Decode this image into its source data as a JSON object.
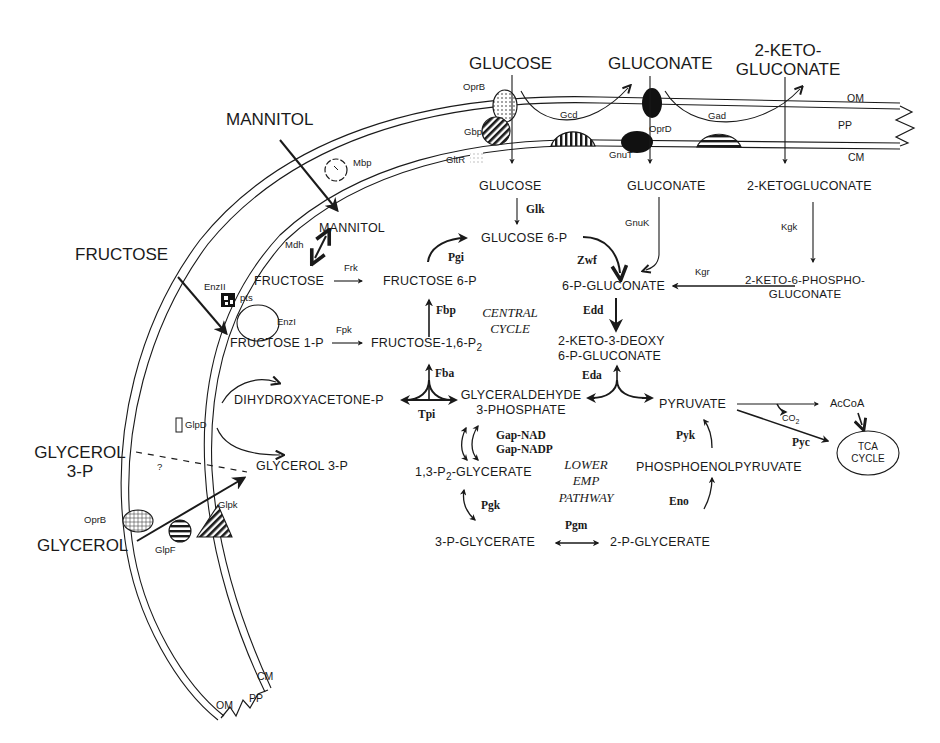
{
  "membrane": {
    "outer_membrane": "OM",
    "periplasm": "PP",
    "cytoplasmic_membrane": "CM"
  },
  "external_substrates": {
    "glucose": "GLUCOSE",
    "gluconate": "GLUCONATE",
    "ketogluconate_line1": "2-KETO-",
    "ketogluconate_line2": "GLUCONATE",
    "mannitol": "MANNITOL",
    "fructose": "FRUCTOSE",
    "glycerol3p_line1": "GLYCEROL",
    "glycerol3p_line2": "3-P",
    "glycerol": "GLYCEROL"
  },
  "transporters": {
    "oprB_top": "OprB",
    "gbp": "Gbp",
    "gltR": "GltR",
    "gcd": "Gcd",
    "oprD": "OprD",
    "gnuT": "GnuT",
    "gad": "Gad",
    "mbp": "Mbp",
    "enzII": "EnzII",
    "pts": "pts",
    "enzI": "EnzI",
    "glpD": "GlpD",
    "question": "?",
    "oprB_bottom": "OprB",
    "glpF": "GlpF",
    "glpK": "Glpk"
  },
  "metabolites": {
    "glucose": "GLUCOSE",
    "gluconate": "GLUCONATE",
    "ketogluconate": "2-KETOGLUCONATE",
    "mannitol": "MANNITOL",
    "fructose": "FRUCTOSE",
    "glucose6p": "GLUCOSE 6-P",
    "fructose6p": "FRUCTOSE 6-P",
    "p_gluconate": "6-P-GLUCONATE",
    "keto6p_line1": "2-KETO-6-PHOSPHO-",
    "keto6p_line2": "GLUCONATE",
    "fructose1p": "FRUCTOSE 1-P",
    "fructose16p2": "FRUCTOSE-1,6-P",
    "fructose16p2_sub": "2",
    "kdpg_line1": "2-KETO-3-DEOXY",
    "kdpg_line2": "6-P-GLUCONATE",
    "dhap": "DIHYDROXYACETONE-P",
    "gap_line1": "GLYCERALDEHYDE",
    "gap_line2": "3-PHOSPHATE",
    "pyruvate": "PYRUVATE",
    "acCoA": "AcCoA",
    "co2": "CO",
    "co2_sub": "2",
    "tca_line1": "TCA",
    "tca_line2": "CYCLE",
    "glycerol3p": "GLYCEROL 3-P",
    "bpg_prefix": "1,3-P",
    "bpg_sub": "2",
    "bpg_suffix": "-GLYCERATE",
    "pep": "PHOSPHOENOLPYRUVATE",
    "pg3": "3-P-GLYCERATE",
    "pg2": "2-P-GLYCERATE"
  },
  "enzymes": {
    "glk": "Glk",
    "gnuK": "GnuK",
    "kgk": "Kgk",
    "kgr": "Kgr",
    "mdh": "Mdh",
    "frk": "Frk",
    "fpk": "Fpk",
    "pgi": "Pgi",
    "zwf": "Zwf",
    "fbp": "Fbp",
    "edd": "Edd",
    "fba": "Fba",
    "eda": "Eda",
    "tpi": "Tpi",
    "gapNAD": "Gap-NAD",
    "gapNADP": "Gap-NADP",
    "pyk": "Pyk",
    "pyc": "Pyc",
    "pgk": "Pgk",
    "pgm": "Pgm",
    "eno": "Eno"
  },
  "annotations": {
    "central_line1": "CENTRAL",
    "central_line2": "CYCLE",
    "lower_line1": "LOWER",
    "lower_line2": "EMP",
    "lower_line3": "PATHWAY"
  }
}
